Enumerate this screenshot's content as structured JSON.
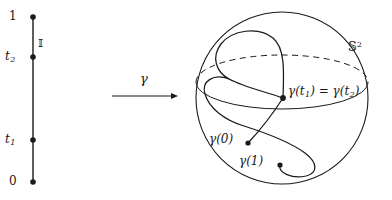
{
  "figure": {
    "caption_present": false,
    "colors": {
      "ink": "#1a1a1a",
      "background": "#ffffff"
    }
  },
  "interval": {
    "name": "unit-interval",
    "axis_label": "ℙ",
    "axis_label_display": "𝕀",
    "ticks": [
      {
        "id": "one",
        "label": "1",
        "y": 17
      },
      {
        "id": "t2",
        "label": "t",
        "sub": "2",
        "y": 57
      },
      {
        "id": "t1",
        "label": "t",
        "sub": "1",
        "y": 140
      },
      {
        "id": "zero",
        "label": "0",
        "y": 182
      }
    ]
  },
  "map_arrow": {
    "label": "γ",
    "from_x": 112,
    "to_x": 178,
    "y": 96
  },
  "sphere": {
    "label_base": "𝕊",
    "label_exponent": "2",
    "center_x": 282,
    "center_y": 98,
    "radius": 86,
    "equator_front_style": "solid",
    "equator_back_style": "dashed"
  },
  "curve": {
    "name": "gamma-path",
    "points": [
      {
        "id": "start",
        "label_base": "γ",
        "label_arg": "(0)",
        "x": 248,
        "y": 143
      },
      {
        "id": "crossing",
        "label_base": "γ",
        "label_arg": "(t",
        "sub": "1",
        "label_eq": ") = ",
        "label_base2": "γ",
        "label_arg2": "(t",
        "sub2": "2",
        "label_close": ")",
        "x": 283,
        "y": 98
      },
      {
        "id": "end",
        "label_base": "γ",
        "label_arg": "(1)",
        "x": 280,
        "y": 165
      }
    ]
  }
}
